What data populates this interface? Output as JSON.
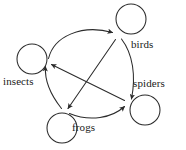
{
  "figure": {
    "kind": "directed-graph",
    "width": 186,
    "height": 150,
    "background_color": "#ffffff",
    "stroke_color": "#2b2b2b",
    "label_color": "#1a1a1a"
  },
  "nodes": [
    {
      "id": "insects",
      "label": "insects",
      "point_x": 47,
      "point_y": 62,
      "loop_cx": 32,
      "loop_cy": 59,
      "loop_r": 15,
      "label_x": 3,
      "label_y": 76
    },
    {
      "id": "birds",
      "label": "birds",
      "point_x": 117,
      "point_y": 35,
      "loop_cx": 131,
      "loop_cy": 19,
      "loop_r": 15,
      "label_x": 131,
      "label_y": 39
    },
    {
      "id": "spiders",
      "label": "spiders",
      "point_x": 128,
      "point_y": 103,
      "loop_cx": 145,
      "loop_cy": 110,
      "loop_r": 15,
      "label_x": 133,
      "label_y": 78
    },
    {
      "id": "frogs",
      "label": "frogs",
      "point_x": 65,
      "point_y": 112,
      "loop_cx": 62,
      "loop_cy": 128,
      "loop_r": 15,
      "label_x": 72,
      "label_y": 122
    }
  ],
  "edges": [
    {
      "id": "insects-to-birds",
      "from": "insects",
      "to": "birds",
      "style": "curved-ring"
    },
    {
      "id": "birds-to-spiders",
      "from": "birds",
      "to": "spiders",
      "style": "curved-ring"
    },
    {
      "id": "frogs-to-spiders",
      "from": "frogs",
      "to": "spiders",
      "style": "curved-ring"
    },
    {
      "id": "frogs-to-insects",
      "from": "frogs",
      "to": "insects",
      "style": "curved-ring"
    },
    {
      "id": "spiders-to-insects",
      "from": "spiders",
      "to": "insects",
      "style": "straight-chord"
    },
    {
      "id": "birds-to-frogs",
      "from": "birds",
      "to": "frogs",
      "style": "straight-chord"
    }
  ],
  "self_loops": [
    {
      "id": "insects-self-loop",
      "node": "insects"
    },
    {
      "id": "birds-self-loop",
      "node": "birds"
    },
    {
      "id": "spiders-self-loop",
      "node": "spiders"
    },
    {
      "id": "frogs-self-loop",
      "node": "frogs"
    }
  ]
}
